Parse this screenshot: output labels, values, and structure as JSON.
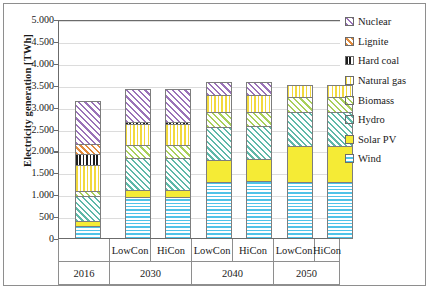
{
  "chart_data": {
    "type": "bar",
    "subtype": "stacked-column",
    "title": "",
    "xlabel": "",
    "ylabel": "Electricity generation [TWh]",
    "ylim": [
      0,
      5000
    ],
    "ytick_step": 500,
    "ytick_labels": [
      "5.000",
      "4.500",
      "4.000",
      "3.500",
      "3.000",
      "2.500",
      "2.000",
      "1.500",
      "1.000",
      "500",
      "0"
    ],
    "ytick_values": [
      5000,
      4500,
      4000,
      3500,
      3000,
      2500,
      2000,
      1500,
      1000,
      500,
      0
    ],
    "grid": true,
    "legend_position": "right",
    "categories": [
      "2016",
      "LowCon 2030",
      "HiCon 2030",
      "LowCon 2040",
      "HiCon 2040",
      "LowCon 2050",
      "HiCon 2050"
    ],
    "group_labels": [
      {
        "label": "2016",
        "span": 1
      },
      {
        "label": "2030",
        "span": 2
      },
      {
        "label": "2040",
        "span": 2
      },
      {
        "label": "2050",
        "span": 2
      }
    ],
    "scenario_labels": [
      "",
      "LowCon",
      "HiCon",
      "LowCon",
      "HiCon",
      "LowCon",
      "HiCon"
    ],
    "series": [
      {
        "name": "Wind",
        "key": "wind",
        "pattern": "horizontal-lines",
        "color": "#4fc3e8",
        "values": [
          290,
          960,
          960,
          1310,
          1320,
          1310,
          1310
        ]
      },
      {
        "name": "Solar PV",
        "key": "solar",
        "pattern": "solid",
        "color": "#f5eb35",
        "values": [
          120,
          170,
          170,
          500,
          500,
          820,
          820
        ]
      },
      {
        "name": "Hydro",
        "key": "hydro",
        "pattern": "diagonal-hatch",
        "color": "#5fb8a8",
        "values": [
          570,
          730,
          730,
          750,
          750,
          770,
          770
        ]
      },
      {
        "name": "Biomass",
        "key": "biomass",
        "pattern": "diagonal-hatch",
        "color": "#a9cf5a",
        "values": [
          110,
          280,
          280,
          330,
          330,
          350,
          350
        ]
      },
      {
        "name": "Natural gas",
        "key": "gas",
        "pattern": "vertical-lines",
        "color": "#f2d93c",
        "values": [
          600,
          490,
          490,
          390,
          380,
          260,
          260
        ]
      },
      {
        "name": "Hard coal",
        "key": "hardcoal",
        "pattern": "vertical-lines",
        "color": "#1d1d1d",
        "values": [
          250,
          40,
          40,
          0,
          0,
          0,
          0
        ]
      },
      {
        "name": "Lignite",
        "key": "lignite",
        "pattern": "diagonal-hatch",
        "color": "#e08a3c",
        "values": [
          240,
          0,
          0,
          0,
          0,
          0,
          0
        ]
      },
      {
        "name": "Nuclear",
        "key": "nuclear",
        "pattern": "diagonal-hatch",
        "color": "#9a72b8",
        "values": [
          980,
          750,
          750,
          310,
          310,
          0,
          0
        ]
      }
    ],
    "totals": [
      3160,
      3420,
      3420,
      3590,
      3590,
      3510,
      3510
    ]
  },
  "legend": {
    "items": [
      {
        "label": "Nuclear",
        "key": "nuclear"
      },
      {
        "label": "Lignite",
        "key": "lignite"
      },
      {
        "label": "Hard coal",
        "key": "hardcoal"
      },
      {
        "label": "Natural gas",
        "key": "gas"
      },
      {
        "label": "Biomass",
        "key": "biomass"
      },
      {
        "label": "Hydro",
        "key": "hydro"
      },
      {
        "label": "Solar PV",
        "key": "solar"
      },
      {
        "label": "Wind",
        "key": "wind"
      }
    ]
  }
}
